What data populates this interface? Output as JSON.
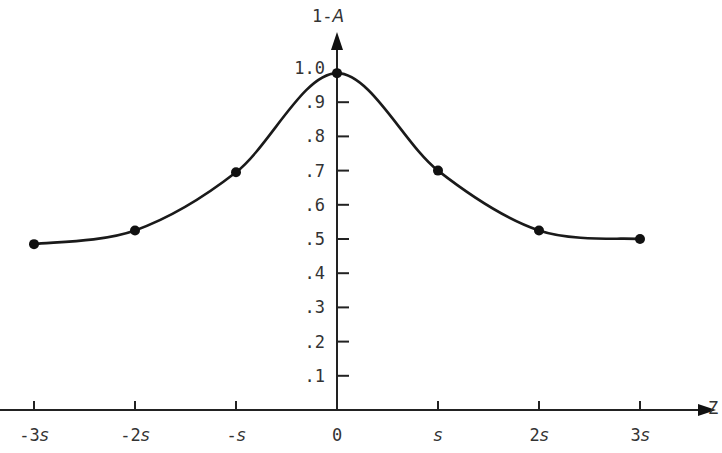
{
  "chart_data": {
    "type": "line",
    "title": "",
    "xlabel": "Z",
    "ylabel": "1-A",
    "x_ticks": [
      "-3s",
      "-2s",
      "-s",
      "0",
      "s",
      "2s",
      "3s"
    ],
    "y_ticks": [
      ".1",
      ".2",
      ".3",
      ".4",
      ".5",
      ".6",
      ".7",
      ".8",
      ".9",
      "1.0"
    ],
    "x": [
      -3,
      -2,
      -1,
      0,
      1,
      2,
      3
    ],
    "values": [
      0.485,
      0.525,
      0.695,
      0.985,
      0.7,
      0.525,
      0.5
    ],
    "ylim": [
      0,
      1.0
    ],
    "grid": false,
    "legend": null,
    "markers": true,
    "smooth_curve": true
  },
  "axes": {
    "x_label": "Z",
    "y_label_prefix": "1-",
    "y_label_var": "A"
  }
}
